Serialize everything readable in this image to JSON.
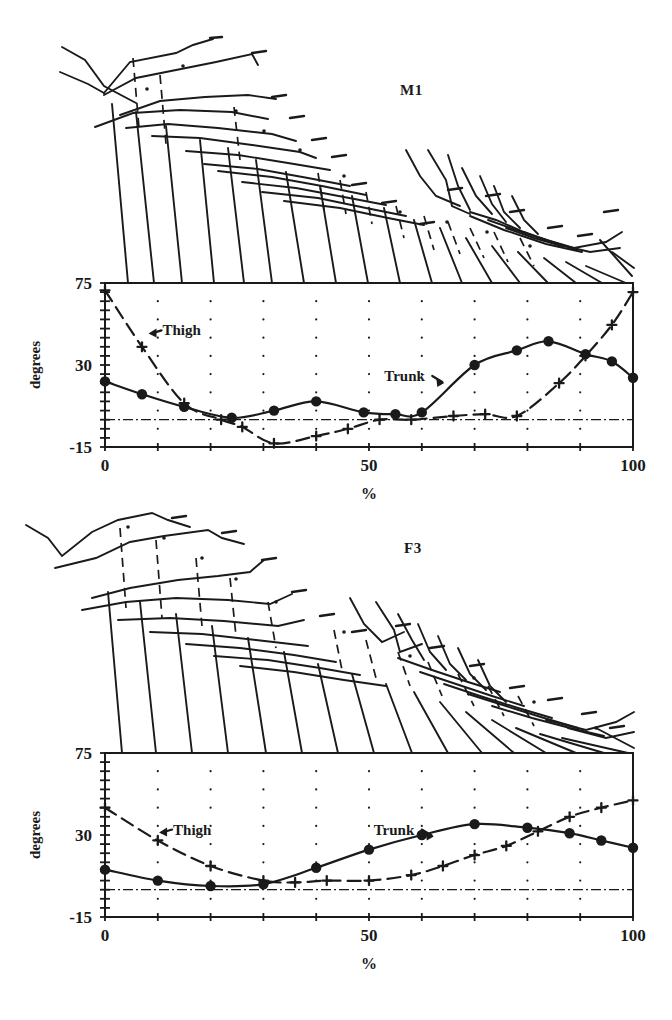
{
  "figure": {
    "kind": "gait-analysis-figure",
    "panel_count": 2
  },
  "panels": [
    {
      "id": "m1",
      "label": "M1",
      "stick_caption": "",
      "chart_data": {
        "type": "line",
        "title": "M1",
        "xlabel": "%",
        "ylabel": "degrees",
        "xlim": [
          0,
          100
        ],
        "ylim": [
          -15,
          75
        ],
        "yticks": [
          -15,
          30,
          75
        ],
        "ytick_labels": [
          "-15",
          "30",
          "75"
        ],
        "yminor_step": 5,
        "xticks": [
          0,
          10,
          20,
          30,
          40,
          50,
          60,
          70,
          80,
          90,
          100
        ],
        "xtick_labels": [
          "0",
          "50",
          "100"
        ],
        "xtick_label_values": [
          0,
          50,
          100
        ],
        "grid": "dotted-points",
        "zero_line": 0,
        "zero_line_style": "dash-dot",
        "legend": "inline-annotated",
        "series": [
          {
            "name": "Trunk",
            "marker": "filled-circle",
            "line": "solid",
            "x": [
              0,
              7,
              15,
              24,
              32,
              40,
              49,
              55,
              60,
              70,
              78,
              84,
              91,
              96,
              100
            ],
            "values": [
              21,
              14,
              7,
              1,
              5,
              10,
              4,
              3,
              4,
              30,
              38,
              43,
              36,
              32,
              23
            ]
          },
          {
            "name": "Thigh",
            "marker": "plus",
            "line": "dashed",
            "x": [
              0,
              7,
              15,
              22,
              26,
              32,
              40,
              46,
              52,
              58,
              66,
              72,
              78,
              86,
              91,
              96,
              100
            ],
            "values": [
              71,
              40,
              9,
              0,
              -4,
              -13,
              -9,
              -5,
              0,
              0,
              2,
              3,
              2,
              20,
              35,
              52,
              70
            ]
          }
        ],
        "annotations": [
          {
            "text": "Thigh",
            "x": 9,
            "y": 49
          },
          {
            "text": "Trunk",
            "x": 51,
            "y": 24
          }
        ]
      }
    },
    {
      "id": "f3",
      "label": "F3",
      "stick_caption": "",
      "chart_data": {
        "type": "line",
        "title": "F3",
        "xlabel": "%",
        "ylabel": "degrees",
        "xlim": [
          0,
          100
        ],
        "ylim": [
          -15,
          75
        ],
        "yticks": [
          -15,
          30,
          75
        ],
        "ytick_labels": [
          "-15",
          "30",
          "75"
        ],
        "yminor_step": 5,
        "xticks": [
          0,
          10,
          20,
          30,
          40,
          50,
          60,
          70,
          80,
          90,
          100
        ],
        "xtick_labels": [
          "0",
          "50",
          "100"
        ],
        "xtick_label_values": [
          0,
          50,
          100
        ],
        "grid": "dotted-points",
        "zero_line": 0,
        "zero_line_style": "dash-dot",
        "legend": "inline-annotated",
        "series": [
          {
            "name": "Trunk",
            "marker": "filled-circle",
            "line": "solid",
            "x": [
              0,
              10,
              20,
              30,
              40,
              50,
              60,
              70,
              80,
              88,
              94,
              100
            ],
            "values": [
              11,
              5,
              2,
              3,
              12,
              22,
              30,
              36,
              34,
              31,
              27,
              23
            ]
          },
          {
            "name": "Thigh",
            "marker": "plus",
            "line": "dashed",
            "x": [
              0,
              10,
              20,
              30,
              36,
              42,
              50,
              58,
              64,
              70,
              76,
              82,
              88,
              94,
              100
            ],
            "values": [
              45,
              27,
              13,
              5,
              4,
              5,
              5,
              8,
              13,
              19,
              24,
              32,
              40,
              45,
              49
            ]
          }
        ],
        "annotations": [
          {
            "text": "Thigh",
            "x": 11,
            "y": 33
          },
          {
            "text": "Trunk",
            "x": 49,
            "y": 33
          }
        ]
      }
    }
  ],
  "style": {
    "ink": "#1a1a1a",
    "background": "#ffffff"
  }
}
